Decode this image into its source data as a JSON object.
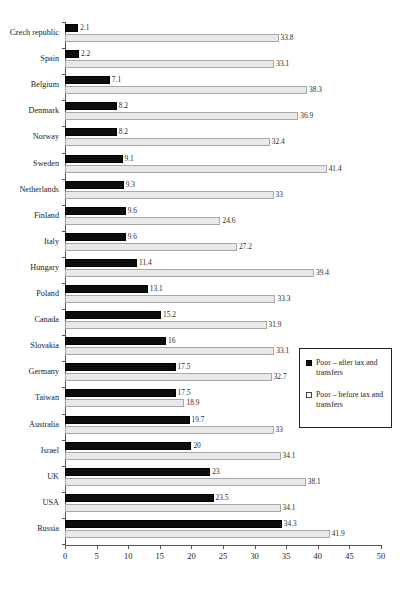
{
  "chart_data": {
    "type": "bar",
    "orientation": "horizontal",
    "title": "",
    "xlabel": "",
    "ylabel": "",
    "xlim": [
      0,
      50
    ],
    "xticks": [
      0,
      5,
      10,
      15,
      20,
      25,
      30,
      35,
      40,
      45,
      50
    ],
    "grid": false,
    "legend_position": "middle-right",
    "categories": [
      "Czech republic",
      "Spain",
      "Belgium",
      "Denmark",
      "Norway",
      "Sweden",
      "Netherlands",
      "Finland",
      "Italy",
      "Hungary",
      "Poland",
      "Canada",
      "Slovakia",
      "Germany",
      "Taiwan",
      "Australia",
      "Israel",
      "UK",
      "USA",
      "Russia"
    ],
    "series": [
      {
        "name": "Poor – after tax and transfers",
        "color": "#0d0d0d",
        "values": [
          2.1,
          2.2,
          7.1,
          8.2,
          8.2,
          9.1,
          9.3,
          9.6,
          9.6,
          11.4,
          13.1,
          15.2,
          16,
          17.5,
          17.5,
          19.7,
          20,
          23,
          23.5,
          34.3
        ],
        "labels": [
          "2.1",
          "2.2",
          "7.1",
          "8.2",
          "8.2",
          "9.1",
          "9.3",
          "9.6",
          "9.6",
          "11.4",
          "13.1",
          "15.2",
          "16",
          "17.5",
          "17.5",
          "19.7",
          "20",
          "23",
          "23.5",
          "34.3"
        ]
      },
      {
        "name": "Poor – before tax and transfers",
        "color": "#e9e9e9",
        "values": [
          33.8,
          33.1,
          38.3,
          36.9,
          32.4,
          41.4,
          33,
          24.6,
          27.2,
          39.4,
          33.3,
          31.9,
          33.1,
          32.7,
          18.9,
          33,
          34.1,
          38.1,
          34.1,
          41.9
        ],
        "labels": [
          "33.8",
          "33.1",
          "38.3",
          "36.9",
          "32.4",
          "41.4",
          "33",
          "24.6",
          "27.2",
          "39.4",
          "33.3",
          "31.9",
          "33.1",
          "32.7",
          "18.9",
          "33",
          "34.1",
          "38.1",
          "34.1",
          "41.9"
        ]
      }
    ]
  },
  "legend": {
    "items": [
      {
        "swatch": "filled",
        "label": "Poor – after tax and transfers"
      },
      {
        "swatch": "hollow",
        "label": "Poor – before tax and transfers"
      }
    ]
  }
}
